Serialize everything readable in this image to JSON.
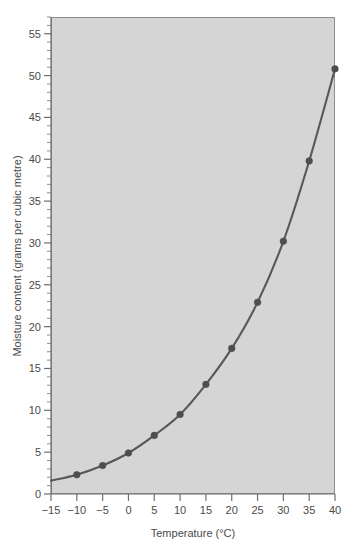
{
  "chart_data": {
    "type": "line",
    "title": "",
    "subtitle": "",
    "xlabel": "Temperature (°C)",
    "ylabel": "Moisture content (grams per cubic metre)",
    "xlim": [
      -15,
      40
    ],
    "ylim": [
      0,
      57
    ],
    "x_tick_step": 5,
    "y_tick_step": 5,
    "y_minor_tick_step": 1,
    "grid": false,
    "legend": "none",
    "x_ticks": [
      -15,
      -10,
      -5,
      0,
      5,
      10,
      15,
      20,
      25,
      30,
      35,
      40
    ],
    "x_tick_labels": [
      "-15",
      "-10",
      "-5",
      "0",
      "5",
      "10",
      "15",
      "20",
      "25",
      "30",
      "35",
      "40"
    ],
    "y_ticks": [
      0,
      5,
      10,
      15,
      20,
      25,
      30,
      35,
      40,
      45,
      50,
      55
    ],
    "y_tick_labels": [
      "0",
      "5",
      "10",
      "15",
      "20",
      "25",
      "30",
      "35",
      "40",
      "45",
      "50",
      "55"
    ],
    "series": [
      {
        "name": "Saturation moisture content",
        "marker": "circle",
        "color": "#4e4e4e",
        "x": [
          -15,
          -10,
          -5,
          0,
          5,
          10,
          15,
          20,
          25,
          30,
          35,
          40
        ],
        "values": [
          1.6,
          2.3,
          3.4,
          4.9,
          7.0,
          9.5,
          13.1,
          17.4,
          22.9,
          30.2,
          39.8,
          50.8
        ],
        "marker_x": [
          -10,
          -5,
          0,
          5,
          10,
          15,
          20,
          25,
          30,
          35,
          40
        ],
        "marker_values": [
          2.3,
          3.4,
          4.9,
          7.0,
          9.5,
          13.1,
          17.4,
          22.9,
          30.2,
          39.8,
          50.8
        ]
      }
    ],
    "colors": {
      "plot_background": "#d5d5d5",
      "page_background": "#ffffff",
      "line": "#585858",
      "marker": "#4e4e4e",
      "axis": "#6e6e6e",
      "text": "#4a4a4a"
    }
  }
}
